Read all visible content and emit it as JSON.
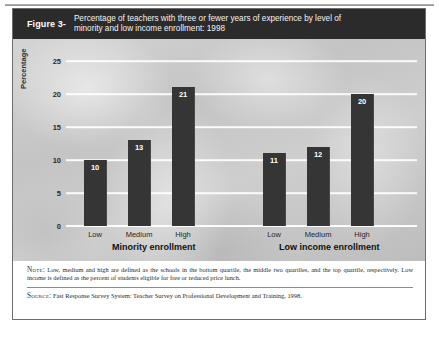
{
  "figure": {
    "number": "Figure 3-",
    "title_line1": "Percentage of teachers with three or fewer years of experience by level of",
    "title_line2": "minority and low income enrollment: 1998"
  },
  "notes": {
    "note_label": "Note:",
    "note_text": " Low, medium and high are defined as the schools in the bottom quartile, the middle two quartiles, and the top quartile, respectively. Low income is defined as the percent of students eligible for free or reduced price lunch.",
    "source_label": "Source:",
    "source_text": " Fast Response Survey System: Teacher Survey on Professional Development and Training, 1998."
  },
  "colors": {
    "banner": "#2b2b2b",
    "bar": "#353535",
    "plot_background": "#c9c9c9",
    "gridline": "#ffffff"
  },
  "chart_data": {
    "type": "bar",
    "title": "Percentage of teachers with three or fewer years of experience by level of minority and low income enrollment: 1998",
    "xlabel": "",
    "ylabel": "Percentage",
    "ylim": [
      0,
      25
    ],
    "yticks": [
      "0",
      "5",
      "10",
      "15",
      "20",
      "25"
    ],
    "ytick_values": [
      0,
      5,
      10,
      15,
      20,
      25
    ],
    "grid": true,
    "legend": "none",
    "categories": [
      "Low",
      "Medium",
      "High"
    ],
    "groups": [
      {
        "name": "Minority enrollment",
        "categories": [
          "Low",
          "Medium",
          "High"
        ],
        "values": [
          10,
          13,
          21
        ],
        "labels": [
          "10",
          "13",
          "21"
        ]
      },
      {
        "name": "Low income enrollment",
        "categories": [
          "Low",
          "Medium",
          "High"
        ],
        "values": [
          11,
          12,
          20
        ],
        "labels": [
          "11",
          "12",
          "20"
        ]
      }
    ]
  }
}
